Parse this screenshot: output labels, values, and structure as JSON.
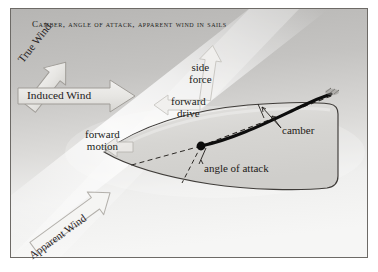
{
  "figure": {
    "title": "Camber, angle of attack, apparent wind in sails",
    "domain": "diagram",
    "frame": {
      "border_color": "#6d6a66",
      "outside_color": "#ffffff",
      "background_top_color": "#b9b8b6",
      "background_bottom_color": "#f4f4f3"
    },
    "colors": {
      "sail_curve": "#0d0d0d",
      "hull_outline": "#3c3936",
      "hull_fill": "#d8d7d4",
      "arrow_fill": "#e9e8e5",
      "arrow_outline": "#a5a29d",
      "dashed_line": "#2b2825",
      "text": "#1d1a17"
    }
  },
  "labels": {
    "true_wind": "True Wind",
    "induced_wind": "Induced Wind",
    "apparent_wind": "Apparent Wind",
    "side_force_line1": "side",
    "side_force_line2": "force",
    "forward_drive_line1": "forward",
    "forward_drive_line2": "drive",
    "forward_motion_line1": "forward",
    "forward_motion_line2": "motion",
    "camber": "camber",
    "angle_of_attack": "angle of attack"
  },
  "arrows": [
    {
      "name": "true-wind-arrow",
      "direction": "up-right",
      "angle_deg": -52,
      "style": "outlined-block"
    },
    {
      "name": "induced-wind-arrow",
      "direction": "right",
      "angle_deg": 0,
      "style": "outlined-block"
    },
    {
      "name": "apparent-wind-arrow",
      "direction": "up-right",
      "angle_deg": -36,
      "style": "outlined-block"
    },
    {
      "name": "side-force-arrow",
      "direction": "up",
      "angle_deg": -82,
      "style": "pale-block"
    },
    {
      "name": "forward-drive-arrow",
      "direction": "left",
      "angle_deg": 180,
      "style": "pale-block"
    },
    {
      "name": "forward-motion-arrow",
      "direction": "left",
      "angle_deg": 180,
      "style": "pale-block"
    }
  ],
  "features": {
    "mast_point": {
      "x": 201,
      "y": 146
    },
    "clew_point": {
      "x": 330,
      "y": 94
    },
    "chord_line": "dashed straight line from mast to clew",
    "camber_markers": "double leader arrows between sail curve and chord line",
    "angle_of_attack_markers": "two dashed rays from mast showing angle between boat centreline and apparent wind"
  }
}
